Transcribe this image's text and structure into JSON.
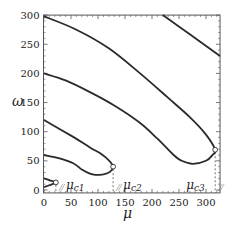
{
  "chart_data": {
    "type": "line",
    "title": "",
    "xlabel": "μ",
    "ylabel": "ω",
    "xlim": [
      0,
      326
    ],
    "ylim": [
      -5,
      300
    ],
    "x_ticks": [
      0,
      50,
      100,
      150,
      200,
      250,
      300
    ],
    "y_ticks": [
      0,
      50,
      100,
      150,
      200,
      250,
      300
    ],
    "grid": false,
    "legend": null,
    "series": [
      {
        "name": "branch-3-fold",
        "points": [
          [
            0,
            298
          ],
          [
            60,
            275
          ],
          [
            120,
            243
          ],
          [
            178,
            200
          ],
          [
            230,
            158
          ],
          [
            270,
            125
          ],
          [
            300,
            95
          ],
          [
            317,
            69
          ],
          [
            312,
            60
          ],
          [
            300,
            50
          ],
          [
            276,
            45
          ],
          [
            255,
            50
          ],
          [
            240,
            60
          ],
          [
            210,
            88
          ],
          [
            178,
            115
          ],
          [
            130,
            145
          ],
          [
            85,
            168
          ],
          [
            40,
            188
          ],
          [
            0,
            200
          ]
        ]
      },
      {
        "name": "branch-2-fold",
        "points": [
          [
            0,
            120
          ],
          [
            54,
            91
          ],
          [
            85,
            73
          ],
          [
            104,
            63
          ],
          [
            120,
            51
          ],
          [
            128,
            40
          ],
          [
            122,
            31
          ],
          [
            110,
            27
          ],
          [
            95,
            26
          ],
          [
            85,
            28
          ],
          [
            70,
            35
          ],
          [
            54,
            46
          ],
          [
            25,
            55
          ],
          [
            0,
            60
          ]
        ]
      },
      {
        "name": "branch-1-fold",
        "points": [
          [
            0,
            20
          ],
          [
            12,
            16
          ],
          [
            22,
            13
          ],
          [
            12,
            9
          ],
          [
            0,
            5
          ]
        ]
      },
      {
        "name": "branch-4",
        "points": [
          [
            220,
            300
          ],
          [
            270,
            267
          ],
          [
            326,
            230
          ]
        ]
      }
    ],
    "critical_points": [
      {
        "label": "μ",
        "sub": "c1",
        "mu": 22,
        "omega": 13
      },
      {
        "label": "μ",
        "sub": "c2",
        "mu": 128,
        "omega": 40
      },
      {
        "label": "μ",
        "sub": "c3",
        "mu": 317,
        "omega": 69
      }
    ],
    "colors": {
      "curve": "#2a2a2a",
      "frame": "#555555",
      "dash": "#555555"
    }
  }
}
